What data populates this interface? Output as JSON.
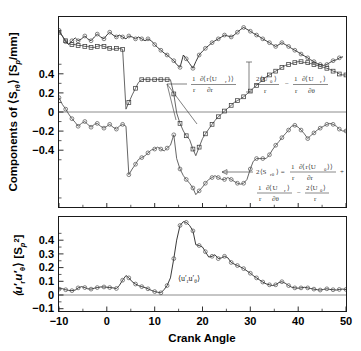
{
  "figure": {
    "title": "",
    "xlabel": "Crank Angle"
  },
  "panels": {
    "top": {
      "ylabel_parts": {
        "prefix": "Components of",
        "symbol": "⟨S",
        "symbol_sub": "rθ",
        "symbol_close": "⟩",
        "units": "[S",
        "units_sub": "p",
        "units_rest": "/mm]"
      },
      "ylabel_plain": "Components of ⟨S_rθ⟩ [S_p/mm]",
      "yticks": [
        "0.4",
        "0.2",
        "0",
        "−0.2",
        "−0.4"
      ],
      "ytickvals": [
        0.4,
        0.2,
        0,
        -0.2,
        -0.4
      ],
      "ylim": [
        -0.5,
        0.5
      ],
      "xlim": [
        -10,
        50
      ],
      "annotations": [
        {
          "name": "annotation-dr-term",
          "numerator": "1 ∂⟨r⟨U_r⟩⟩",
          "denominator": "r  ∂r",
          "text": "1/r ∂⟨r⟨U_r⟩⟩/∂r",
          "num_left": "1",
          "num_right": "∂⟨r⟨U",
          "num_sub": "r",
          "num_tail": "⟩⟩",
          "den_left": "r",
          "den_right": "∂r"
        },
        {
          "name": "annotation-theta-term",
          "text": "2⟨U_θ⟩/r − (1/r)∂⟨U_r⟩/∂θ",
          "term1_num": "2⟨U",
          "term1_sub": "θ",
          "term1_close": "⟩",
          "term1_den": "r",
          "minus": "−",
          "term2_num_left": "1",
          "term2_num_right": "∂⟨U",
          "term2_sub": "r",
          "term2_close": "⟩",
          "term2_den_left": "r",
          "term2_den_right": "∂θ"
        },
        {
          "name": "annotation-sum-equation",
          "text": "2⟨S_rθ⟩ = (1/r)∂⟨r⟨U_θ⟩⟩/∂r + (1/r)∂⟨U_r⟩/∂θ − 2⟨U_θ⟩/r",
          "lhs": "2⟨S",
          "lhs_sub": "rθ",
          "lhs_close": "⟩ =",
          "l1_num_left": "1",
          "l1_num_right": "∂⟨r⟨U",
          "l1_sub": "θ",
          "l1_tail": "⟩⟩",
          "l1_den_left": "r",
          "l1_den_right": "∂r",
          "plus": "+",
          "l2a_num_left": "1",
          "l2a_num_right": "∂⟨U",
          "l2a_sub": "r",
          "l2a_close": "⟩",
          "l2a_den_left": "r",
          "l2a_den_right": "∂θ",
          "l2_minus": "−",
          "l2b_num": "2⟨U",
          "l2b_sub": "θ",
          "l2b_close": "⟩",
          "l2b_den": "r"
        }
      ]
    },
    "bottom": {
      "ylabel_plain": "⟨u'_r u'_θ⟩ [S_p²]",
      "ylabel_parts": {
        "open": "⟨u′",
        "sub1": "r",
        "mid": "u′",
        "sub2": "θ",
        "close": "⟩ [S",
        "sub3": "p",
        "sup": "2",
        "end": "]"
      },
      "yticks": [
        "0.4",
        "0.3",
        "0.2",
        "0.1",
        "0",
        "−0.1"
      ],
      "ytickvals": [
        0.4,
        0.3,
        0.2,
        0.1,
        0,
        -0.1
      ],
      "ylim": [
        -0.13,
        0.48
      ],
      "xlim": [
        -10,
        50
      ],
      "inline_label": "⟨u′_r u′_θ⟩",
      "inline_label_parts": {
        "open": "⟨u′",
        "sub1": "r",
        "mid": "u′",
        "sub2": "θ",
        "close": "⟩"
      }
    }
  },
  "xticks": [
    "−10",
    "0",
    "10",
    "20",
    "30",
    "40",
    "50"
  ],
  "xtickvals": [
    -10,
    0,
    10,
    20,
    30,
    40,
    50
  ],
  "colors": {
    "axis": "#1a1a1a",
    "curve_light": "#4a4a4a",
    "curve_dark": "#242424",
    "marker_circle": "#5a5a5a",
    "marker_square": "#3d3d3d",
    "zeroline": "#6f6f6f",
    "background": "#ffffff"
  },
  "chart_data": {
    "type": "line",
    "title": "",
    "xlabel": "Crank Angle",
    "panels": [
      {
        "name": "top-panel",
        "ylabel": "Components of ⟨S_rθ⟩ [S_p/mm]",
        "xlim": [
          -10,
          50
        ],
        "ylim": [
          -0.5,
          0.5
        ],
        "grid": false,
        "legend": "inline annotations with leader lines",
        "series": [
          {
            "name": "2⟨S_rθ⟩ (sum, circles)",
            "marker": "circle",
            "x": [
              -10,
              -9.3,
              -8.6,
              -8,
              -7.3,
              -6.6,
              -6,
              -5.3,
              -4.6,
              -4,
              -3.3,
              -2.6,
              -2,
              -1.3,
              -0.6,
              0,
              0.6,
              1.3,
              2,
              2.6,
              3.3,
              4,
              4.6,
              5.3,
              6,
              6.6,
              7.3,
              8,
              8.6,
              9.3,
              10,
              10.6,
              11.3,
              12,
              12.6,
              13.3,
              14,
              14.6,
              15.3,
              16,
              16.6,
              17.3,
              18,
              18.6,
              19.3,
              20,
              20.6,
              21.3,
              22,
              22.6,
              23.3,
              24,
              24.6,
              25.3,
              26,
              26.6,
              27.3,
              28,
              28.6,
              29.3,
              30,
              30.6,
              31.3,
              32,
              32.6,
              33.3,
              34,
              34.6,
              35.3,
              36,
              36.6,
              37.3,
              38,
              38.6,
              39.3,
              40,
              40.6,
              41.3,
              42,
              42.6,
              43.3,
              44,
              44.6,
              45.3,
              46,
              46.6,
              47.3,
              48,
              48.6,
              49.3,
              50
            ],
            "y": [
              0.43,
              0.4,
              0.37,
              0.355,
              0.375,
              0.39,
              0.375,
              0.385,
              0.4,
              0.385,
              0.375,
              0.395,
              0.41,
              0.395,
              0.385,
              0.405,
              0.42,
              0.405,
              0.395,
              0.405,
              0.395,
              0.385,
              0.4,
              0.395,
              0.385,
              0.395,
              0.385,
              0.375,
              0.385,
              0.375,
              0.355,
              0.34,
              0.325,
              0.31,
              0.3,
              0.285,
              0.27,
              0.25,
              0.235,
              0.3,
              0.28,
              0.255,
              0.23,
              0.265,
              0.3,
              0.32,
              0.335,
              0.35,
              0.365,
              0.375,
              0.385,
              0.395,
              0.405,
              0.4,
              0.395,
              0.405,
              0.42,
              0.435,
              0.445,
              0.435,
              0.425,
              0.415,
              0.405,
              0.395,
              0.385,
              0.375,
              0.365,
              0.355,
              0.345,
              0.355,
              0.365,
              0.355,
              0.345,
              0.335,
              0.325,
              0.315,
              0.305,
              0.295,
              0.285,
              0.275,
              0.265,
              0.255,
              0.25,
              0.245,
              0.25,
              0.26,
              0.27,
              0.275,
              0.285,
              0.29
            ],
            "note": "Top curve with open-circle markers; the sum 2<S_rtheta>"
          },
          {
            "name": "1/r ∂⟨r⟨U_r⟩⟩/∂r (squares)",
            "marker": "square",
            "x": [
              -10,
              -9.3,
              -8.6,
              -8,
              -7.3,
              -6.6,
              -6,
              -5.3,
              -4.6,
              -4,
              -3.3,
              -2.6,
              -2,
              -1.3,
              -0.6,
              0,
              0.6,
              1.3,
              2,
              2.6,
              3.3,
              4,
              4.6,
              5.3,
              6,
              6.6,
              7.3,
              8,
              8.6,
              9.3,
              10,
              10.6,
              11.3,
              12,
              12.6,
              13.3,
              14,
              14.6,
              15.3,
              16,
              16.6,
              17.3,
              18,
              18.6,
              19.3,
              20,
              20.6,
              21.3,
              22,
              22.6,
              23.3,
              24,
              24.6,
              25.3,
              26,
              26.6,
              27.3,
              28,
              28.6,
              29.3,
              30,
              30.6,
              31.3,
              32,
              32.6,
              33.3,
              34,
              34.6,
              35.3,
              36,
              36.6,
              37.3,
              38,
              38.6,
              39.3,
              40,
              40.6,
              41.3,
              42,
              42.6,
              43.3,
              44,
              44.6,
              45.3,
              46,
              46.6,
              47.3,
              48,
              48.6,
              49.3,
              50
            ],
            "y": [
              0.42,
              0.4,
              0.375,
              0.36,
              0.355,
              0.355,
              0.35,
              0.35,
              0.345,
              0.345,
              0.34,
              0.34,
              0.345,
              0.35,
              0.345,
              0.34,
              0.335,
              0.33,
              0.335,
              0.335,
              0.33,
              0.015,
              0.05,
              0.09,
              0.125,
              0.155,
              0.17,
              0.172,
              0.17,
              0.17,
              0.17,
              0.172,
              0.17,
              0.17,
              0.17,
              0.17,
              0.095,
              -0.005,
              -0.06,
              -0.1,
              -0.125,
              -0.145,
              -0.195,
              -0.23,
              -0.185,
              -0.14,
              -0.115,
              -0.09,
              -0.065,
              -0.045,
              -0.025,
              -0.01,
              0.005,
              0.02,
              0.035,
              0.05,
              0.06,
              0.07,
              0.08,
              0.095,
              0.11,
              0.125,
              0.14,
              0.155,
              0.17,
              0.185,
              0.195,
              0.205,
              0.215,
              0.225,
              0.235,
              0.245,
              0.25,
              0.255,
              0.26,
              0.265,
              0.265,
              0.26,
              0.26,
              0.255,
              0.25,
              0.245,
              0.24,
              0.235,
              0.23,
              0.225,
              0.215,
              0.21,
              0.2,
              0.195,
              0.195
            ],
            "note": "Square-marker series, rises from -0.23 to ~0.26 then levels near 0.2"
          },
          {
            "name": "2⟨U_θ⟩/r − (1/r)∂⟨U_r⟩/∂θ (circles, negative)",
            "marker": "circle",
            "x": [
              -10,
              -9.3,
              -8.6,
              -8,
              -7.3,
              -6.6,
              -6,
              -5.3,
              -4.6,
              -4,
              -3.3,
              -2.6,
              -2,
              -1.3,
              -0.6,
              0,
              0.6,
              1.3,
              2,
              2.6,
              3.3,
              4,
              4.6,
              5.3,
              6,
              6.6,
              7.3,
              8,
              8.6,
              9.3,
              10,
              10.6,
              11.3,
              12,
              12.6,
              13.3,
              14,
              14.6,
              15.3,
              16,
              16.6,
              17.3,
              18,
              18.6,
              19.3,
              20,
              20.6,
              21.3,
              22,
              22.6,
              23.3,
              24,
              24.6,
              25.3,
              26,
              26.6,
              27.3,
              28,
              28.6,
              29.3,
              30,
              30.6,
              31.3,
              32,
              32.6,
              33.3,
              34,
              34.6,
              35.3,
              36,
              36.6,
              37.3,
              38,
              38.6,
              39.3,
              40,
              40.6,
              41.3,
              42,
              42.6,
              43.3,
              44,
              44.6,
              45.3,
              46,
              46.6,
              47.3,
              48,
              48.6,
              49.3,
              50
            ],
            "y": [
              0.075,
              0.04,
              0.015,
              -0.01,
              -0.035,
              -0.055,
              -0.075,
              -0.06,
              -0.05,
              -0.065,
              -0.08,
              -0.065,
              -0.06,
              -0.075,
              -0.085,
              -0.075,
              -0.065,
              -0.08,
              -0.09,
              -0.075,
              -0.065,
              -0.075,
              -0.33,
              -0.3,
              -0.275,
              -0.25,
              -0.24,
              -0.23,
              -0.215,
              -0.2,
              -0.195,
              -0.185,
              -0.195,
              -0.205,
              -0.19,
              -0.175,
              -0.12,
              -0.245,
              -0.3,
              -0.335,
              -0.355,
              -0.375,
              -0.4,
              -0.435,
              -0.415,
              -0.395,
              -0.375,
              -0.355,
              -0.345,
              -0.335,
              -0.345,
              -0.355,
              -0.355,
              -0.345,
              -0.355,
              -0.365,
              -0.375,
              -0.38,
              -0.375,
              -0.355,
              -0.3,
              -0.26,
              -0.245,
              -0.245,
              -0.245,
              -0.245,
              -0.225,
              -0.2,
              -0.175,
              -0.155,
              -0.135,
              -0.115,
              -0.095,
              -0.075,
              -0.07,
              -0.08,
              -0.095,
              -0.115,
              -0.14,
              -0.125,
              -0.11,
              -0.095,
              -0.085,
              -0.075,
              -0.065,
              -0.06,
              -0.065,
              -0.075,
              -0.09,
              -0.1,
              -0.1
            ],
            "note": "Lower circle-marker series spanning roughly 0.08 down to -0.44"
          }
        ]
      },
      {
        "name": "bottom-panel",
        "ylabel": "⟨u'_r u'_θ⟩ [S_p²]",
        "xlim": [
          -10,
          50
        ],
        "ylim": [
          -0.13,
          0.48
        ],
        "grid": false,
        "series": [
          {
            "name": "⟨u'_r u'_θ⟩",
            "marker": "circle",
            "x": [
              -10,
              -9.3,
              -8.6,
              -8,
              -7.3,
              -6.6,
              -6,
              -5.3,
              -4.6,
              -4,
              -3.3,
              -2.6,
              -2,
              -1.3,
              -0.6,
              0,
              0.6,
              1.3,
              2,
              2.6,
              3.3,
              4,
              4.6,
              5.3,
              6,
              6.6,
              7.3,
              8,
              8.6,
              9.3,
              10,
              10.6,
              11.3,
              12,
              12.6,
              13.3,
              14,
              14.6,
              15.3,
              16,
              16.6,
              17.3,
              18,
              18.6,
              19.3,
              20,
              20.6,
              21.3,
              22,
              22.6,
              23.3,
              24,
              24.6,
              25.3,
              26,
              26.6,
              27.3,
              28,
              28.6,
              29.3,
              30,
              30.6,
              31.3,
              32,
              32.6,
              33.3,
              34,
              34.6,
              35.3,
              36,
              36.6,
              37.3,
              38,
              38.6,
              39.3,
              40,
              40.6,
              41.3,
              42,
              42.6,
              43.3,
              44,
              44.6,
              45.3,
              46,
              46.6,
              47.3,
              48,
              48.6,
              49.3,
              50
            ],
            "y": [
              0.012,
              0.015,
              0.008,
              0.004,
              0.002,
              0.006,
              0.02,
              0.028,
              0.022,
              0.014,
              0.012,
              0.018,
              0.022,
              0.026,
              0.026,
              0.024,
              0.022,
              0.02,
              0.016,
              0.035,
              0.07,
              0.1,
              0.085,
              0.06,
              0.045,
              0.035,
              0.028,
              0.022,
              0.014,
              0.004,
              -0.004,
              -0.008,
              -0.012,
              0.01,
              0.035,
              0.085,
              0.21,
              0.33,
              0.425,
              0.45,
              0.445,
              0.425,
              0.39,
              0.3,
              0.295,
              0.285,
              0.255,
              0.22,
              0.225,
              0.235,
              0.21,
              0.215,
              0.225,
              0.215,
              0.185,
              0.175,
              0.165,
              0.155,
              0.145,
              0.13,
              0.115,
              0.1,
              0.085,
              0.07,
              0.058,
              0.046,
              0.04,
              0.035,
              0.04,
              0.055,
              0.06,
              0.05,
              0.035,
              0.025,
              0.02,
              0.018,
              0.02,
              0.024,
              0.02,
              0.016,
              0.012,
              0.008,
              0.006,
              0.01,
              0.014,
              0.01,
              0.008,
              0.006,
              0.01,
              0.012,
              0.01
            ],
            "note": "Single circle-marker curve with a large peak ~0.45 near crank angle 16"
          }
        ]
      }
    ]
  }
}
